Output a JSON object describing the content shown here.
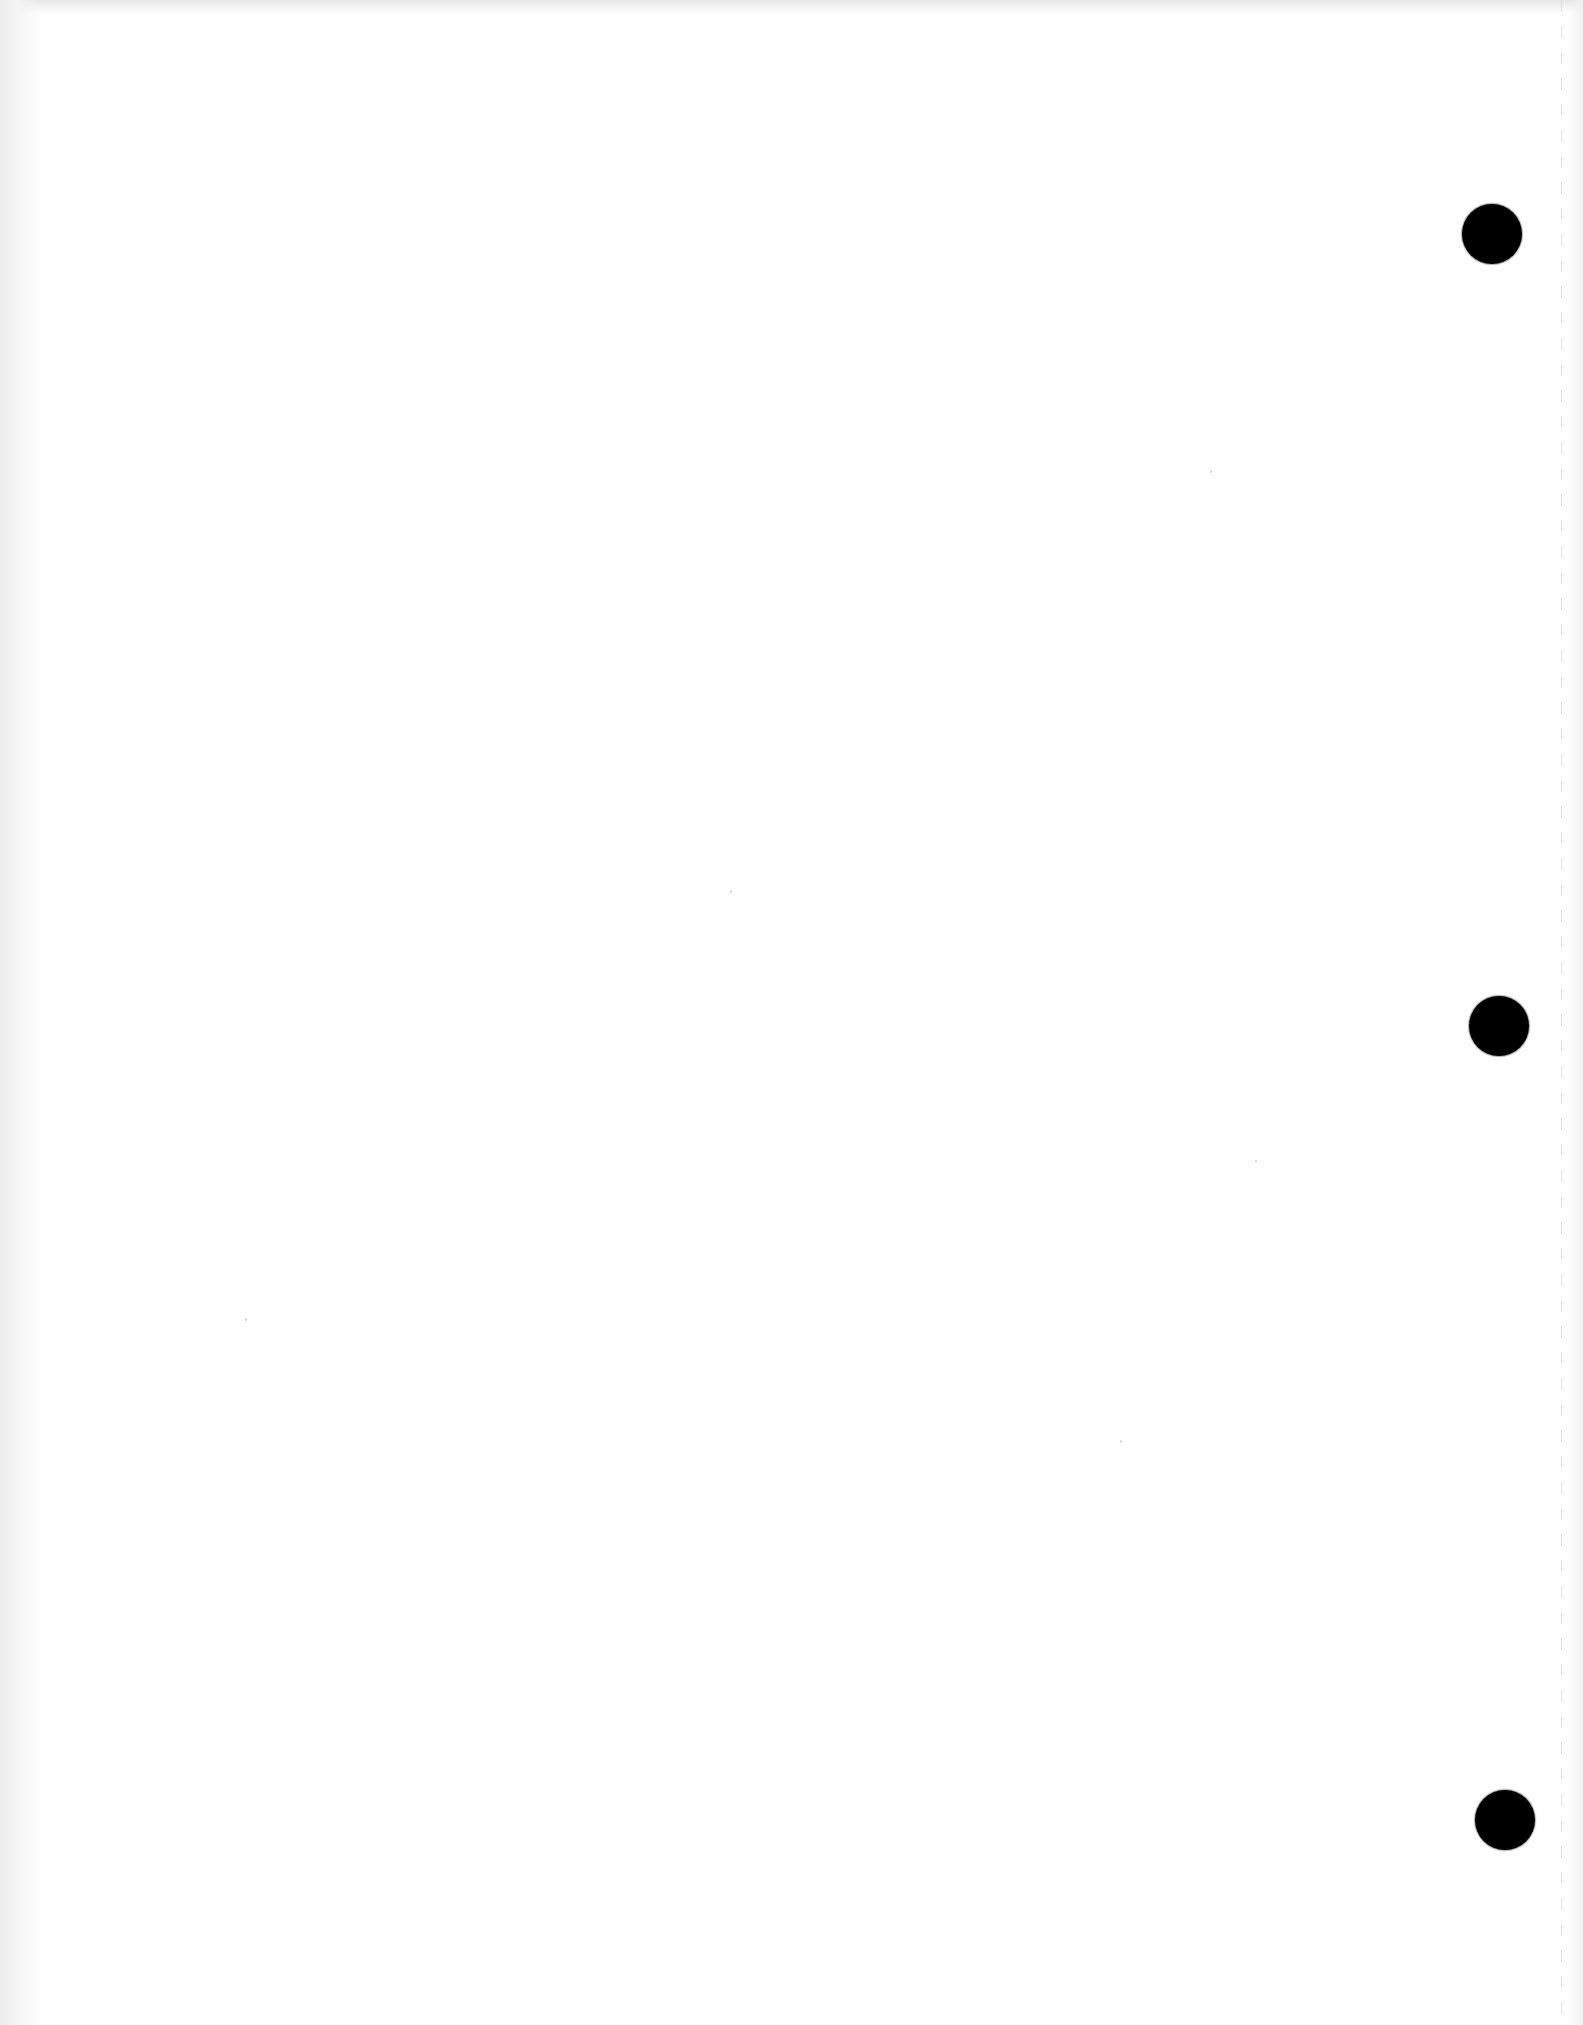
{
  "document": {
    "type": "blank-three-hole-punched-sheet",
    "text": "",
    "background_color": "#fefefe"
  },
  "punch_holes": [
    {
      "label": "top-hole",
      "cx": 1492,
      "cy": 234,
      "diameter": 60,
      "color": "#000000"
    },
    {
      "label": "middle-hole",
      "cx": 1499,
      "cy": 1026,
      "diameter": 60,
      "color": "#000000"
    },
    {
      "label": "bottom-hole",
      "cx": 1505,
      "cy": 1820,
      "diameter": 60,
      "color": "#000000"
    }
  ],
  "perforation_line": {
    "x": 1561,
    "style": "dashed",
    "color": "#dcdcdc"
  },
  "specks": [
    {
      "x": 1210,
      "y": 470
    },
    {
      "x": 730,
      "y": 890
    },
    {
      "x": 1120,
      "y": 1440
    },
    {
      "x": 245,
      "y": 1318
    },
    {
      "x": 1255,
      "y": 1160
    }
  ]
}
